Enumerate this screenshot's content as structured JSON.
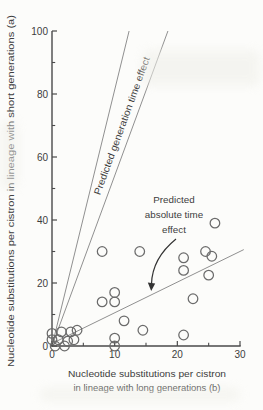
{
  "figure": {
    "background": "#fcfcfa",
    "axis_color": "#4a4a4a",
    "text_color": "#3d3d3d",
    "prediction_line_color": "#909090",
    "point_stroke_color": "#6b6b6b",
    "arrow_color": "#333333"
  },
  "chart_data": {
    "type": "scatter",
    "xlabel": "Nucleotide substitutions per cistron in lineage with long generations (b)",
    "xlabel_lines": [
      "Nucleotide substitutions per cistron",
      "in lineage with long generations (b)"
    ],
    "ylabel": "Nucleotide substitutions per cistron in lineage with short generations (a)",
    "xlim": [
      0,
      30
    ],
    "ylim": [
      0,
      100
    ],
    "x_ticks_major": [
      0,
      10,
      20,
      30
    ],
    "x_ticks_minor": [
      5,
      15,
      25
    ],
    "y_ticks_major": [
      0,
      20,
      40,
      60,
      80,
      100
    ],
    "y_ticks_minor": [
      10,
      30,
      50,
      70,
      90
    ],
    "grid": "off",
    "points": [
      [
        0,
        4
      ],
      [
        1.5,
        4.5
      ],
      [
        3,
        4.5
      ],
      [
        4,
        5
      ],
      [
        0,
        2
      ],
      [
        1,
        2
      ],
      [
        2.5,
        1.5
      ],
      [
        3.5,
        2
      ],
      [
        0.5,
        0
      ],
      [
        2,
        0
      ],
      [
        8,
        14
      ],
      [
        10,
        17
      ],
      [
        10,
        14
      ],
      [
        11.5,
        8
      ],
      [
        10,
        2.5
      ],
      [
        10,
        0
      ],
      [
        14.5,
        5
      ],
      [
        8,
        30
      ],
      [
        14,
        30
      ],
      [
        26,
        39
      ],
      [
        24.5,
        30
      ],
      [
        25.5,
        28.5
      ],
      [
        21,
        28
      ],
      [
        21,
        24
      ],
      [
        25,
        22.5
      ],
      [
        22.5,
        15
      ],
      [
        21,
        3.5
      ]
    ],
    "lines": [
      {
        "name": "generation-time-upper-line",
        "x1": 0,
        "y1": 0,
        "x2": 12.3,
        "y2": 100
      },
      {
        "name": "generation-time-lower-line",
        "x1": 0,
        "y1": 0,
        "x2": 18.5,
        "y2": 100
      },
      {
        "name": "absolute-time-line",
        "x1": 0,
        "y1": 0.8,
        "x2": 30.6,
        "y2": 30.6
      }
    ],
    "annotations": {
      "generation_time_label": "Predicted generation time effect",
      "absolute_time_label_lines": [
        "Predicted",
        "absolute time",
        "effect"
      ]
    }
  }
}
